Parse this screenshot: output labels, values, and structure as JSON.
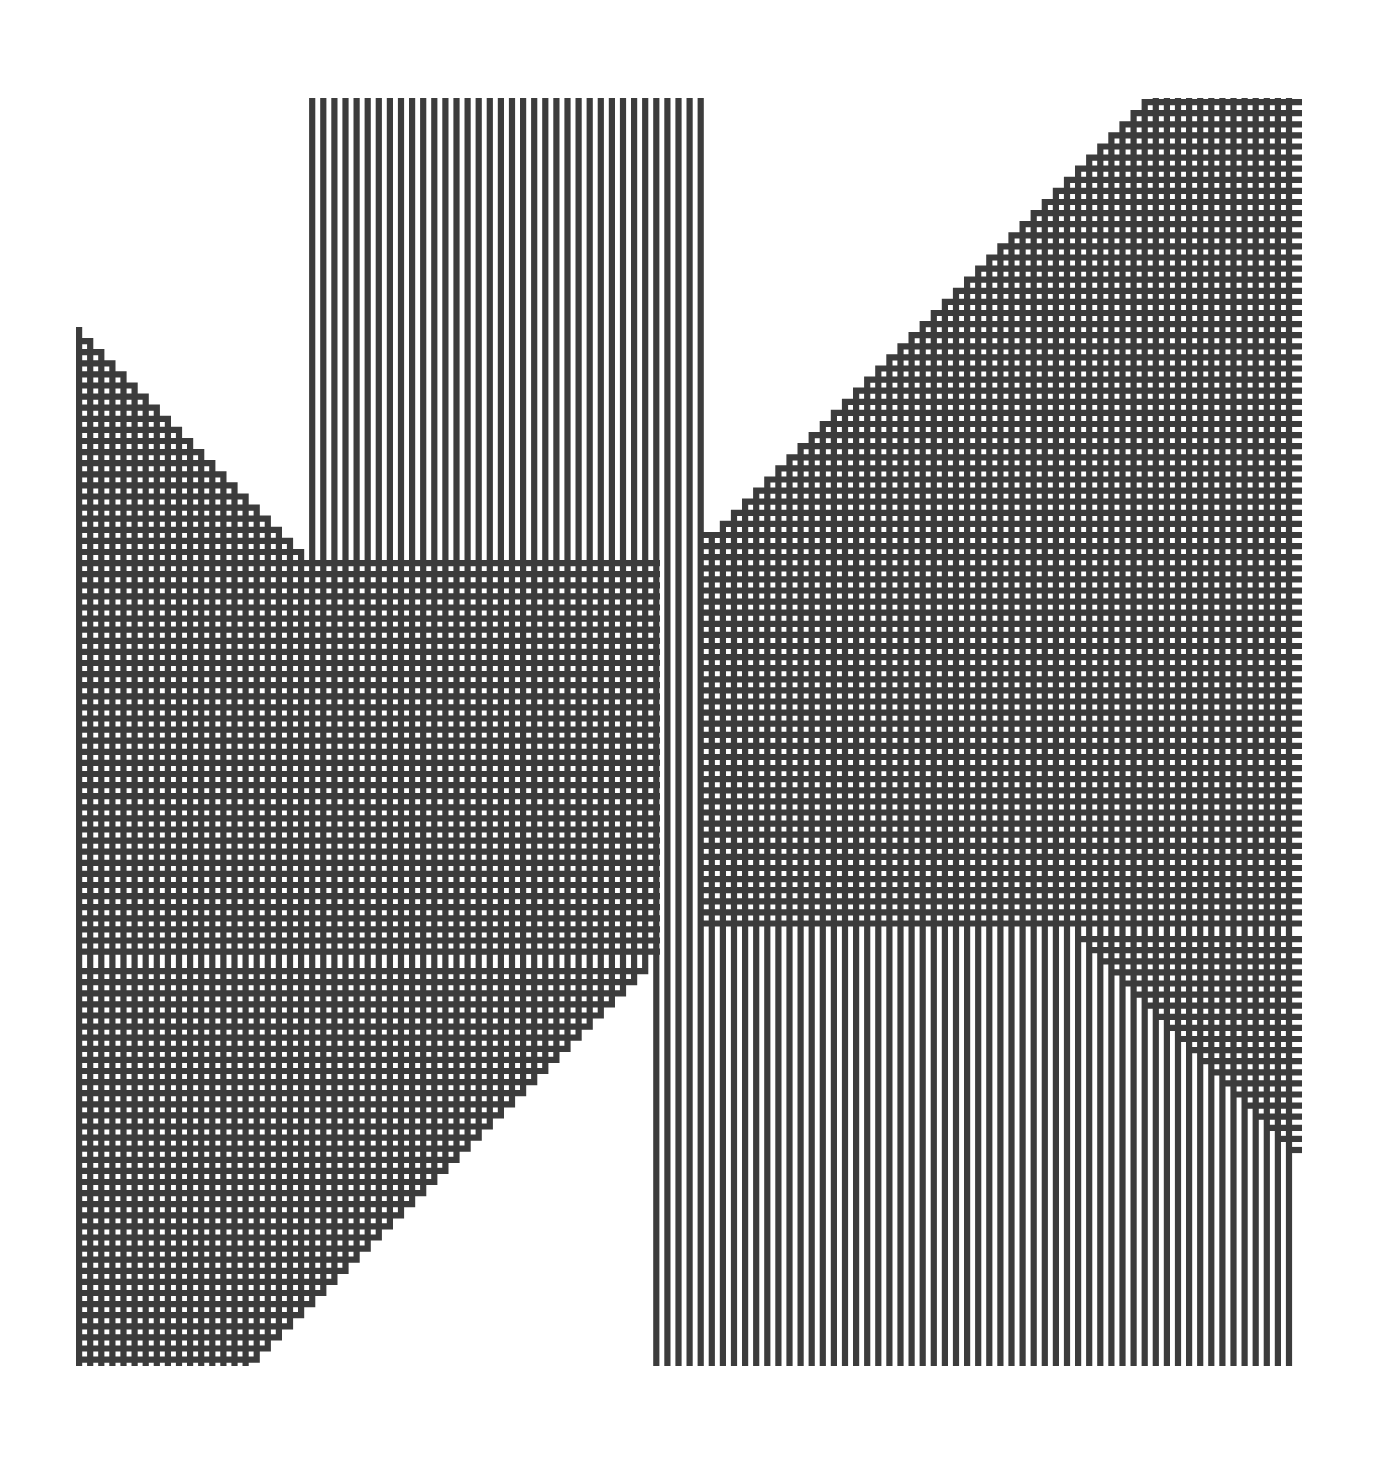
{
  "artwork": {
    "kind": "op-art line pattern",
    "background": "#ffffff",
    "stroke_color": "#3c3c3c",
    "bounds": {
      "x0": 76,
      "y0": 98,
      "x1": 1302,
      "y1": 1366
    },
    "pitch": 11.1,
    "stroke_width": 6.2,
    "upper_front": {
      "start": [
        1090,
        98
      ],
      "end": [
        700,
        535
      ],
      "note": "top-right staircase: horizontal lines from right edge turn up into verticals"
    },
    "upper_left_front": {
      "start": [
        76,
        330
      ],
      "end": [
        700,
        535
      ],
      "note": "left staircase: horizontals from left edge turn up into verticals"
    },
    "lower_front": {
      "start": [
        660,
        960
      ],
      "end": [
        1296,
        1150
      ],
      "note": "right staircase: horizontals from right edge turn down into verticals"
    },
    "lower_left_front": {
      "start": [
        660,
        960
      ],
      "end": [
        290,
        1366
      ],
      "note": "bottom-left staircase: horizontals from left edge turn down into verticals"
    }
  }
}
